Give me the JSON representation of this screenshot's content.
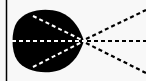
{
  "diagram": {
    "colors": {
      "background": "#f8f8f8",
      "shape": "#000000",
      "inner_dashes": "#ffffff",
      "outer_dashes": "#000000",
      "border": "#000000"
    },
    "convergence_point": [
      84,
      41
    ],
    "inner_lines": 3,
    "outer_lines": 3
  }
}
